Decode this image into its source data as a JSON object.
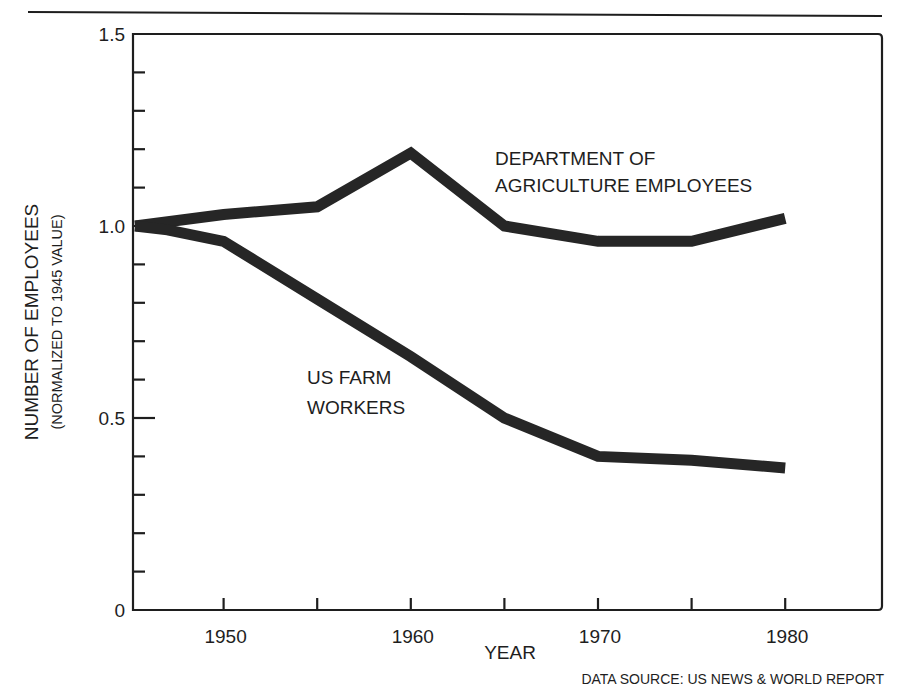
{
  "chart_data": {
    "type": "line",
    "title": "",
    "xlabel": "YEAR",
    "ylabel": "NUMBER OF EMPLOYEES",
    "ylabel_sub": "(NORMALIZED TO 1945 VALUE)",
    "source": "DATA SOURCE:  US NEWS & WORLD REPORT",
    "xlim": [
      1945,
      1985
    ],
    "ylim": [
      0,
      1.5
    ],
    "grid": false,
    "legend_position": "inline annotations",
    "x_ticks": [
      1950,
      1955,
      1960,
      1965,
      1970,
      1975,
      1980
    ],
    "x_tick_labels": [
      "1950",
      "1960",
      "1970",
      "1980"
    ],
    "y_ticks": [
      0,
      0.1,
      0.2,
      0.3,
      0.4,
      0.5,
      0.6,
      0.7,
      0.8,
      0.9,
      1.0,
      1.1,
      1.2,
      1.3,
      1.4,
      1.5
    ],
    "y_tick_labels": [
      "0",
      "0.5",
      "1.0",
      "1.5"
    ],
    "series": [
      {
        "name": "DEPARTMENT OF AGRICULTURE EMPLOYEES",
        "label_lines": [
          "DEPARTMENT OF",
          "AGRICULTURE EMPLOYEES"
        ],
        "x": [
          1945,
          1950,
          1955,
          1960,
          1965,
          1970,
          1975,
          1980
        ],
        "values": [
          1.0,
          1.03,
          1.05,
          1.19,
          1.0,
          0.96,
          0.96,
          1.02
        ]
      },
      {
        "name": "US FARM WORKERS",
        "label_lines": [
          "US FARM",
          "WORKERS"
        ],
        "x": [
          1945,
          1947,
          1950,
          1955,
          1960,
          1965,
          1970,
          1975,
          1980
        ],
        "values": [
          1.0,
          0.99,
          0.96,
          0.81,
          0.66,
          0.5,
          0.4,
          0.39,
          0.37
        ]
      }
    ]
  },
  "colors": {
    "ink": "#1e1e1e",
    "line": "#262626",
    "background": "#ffffff"
  }
}
